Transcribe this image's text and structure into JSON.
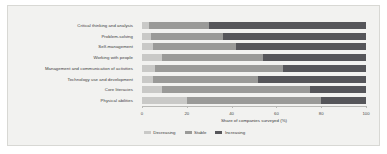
{
  "chart_data": {
    "type": "bar",
    "subtype": "horizontal-stacked-100",
    "title": "",
    "xlabel": "Share of companies surveyed (%)",
    "ylabel": "",
    "xlim": [
      0,
      100
    ],
    "xticks": [
      0,
      20,
      40,
      60,
      80,
      100
    ],
    "xticklabels": [
      "0",
      "20",
      "40",
      "60",
      "80",
      "100"
    ],
    "grid": false,
    "legend_position": "bottom-center",
    "categories": [
      "Critical thinking and analysis",
      "Problem-solving",
      "Self-management",
      "Working with people",
      "Management and communication of activities",
      "Technology use and development",
      "Core literacies",
      "Physical abilities"
    ],
    "series": [
      {
        "name": "Decreasing",
        "color": "#c9c9c7",
        "values": [
          3,
          4,
          5,
          9,
          6,
          5,
          9,
          20
        ]
      },
      {
        "name": "Stable",
        "color": "#9a9a98",
        "values": [
          27,
          32,
          37,
          45,
          57,
          47,
          66,
          60
        ]
      },
      {
        "name": "Increasing",
        "color": "#56565a",
        "values": [
          70,
          64,
          58,
          46,
          37,
          48,
          25,
          20
        ]
      }
    ]
  },
  "axis": {
    "x_title": "Share of companies surveyed (%)"
  },
  "legend": {
    "items": [
      {
        "label": "Decreasing"
      },
      {
        "label": "Stable"
      },
      {
        "label": "Increasing"
      }
    ]
  }
}
